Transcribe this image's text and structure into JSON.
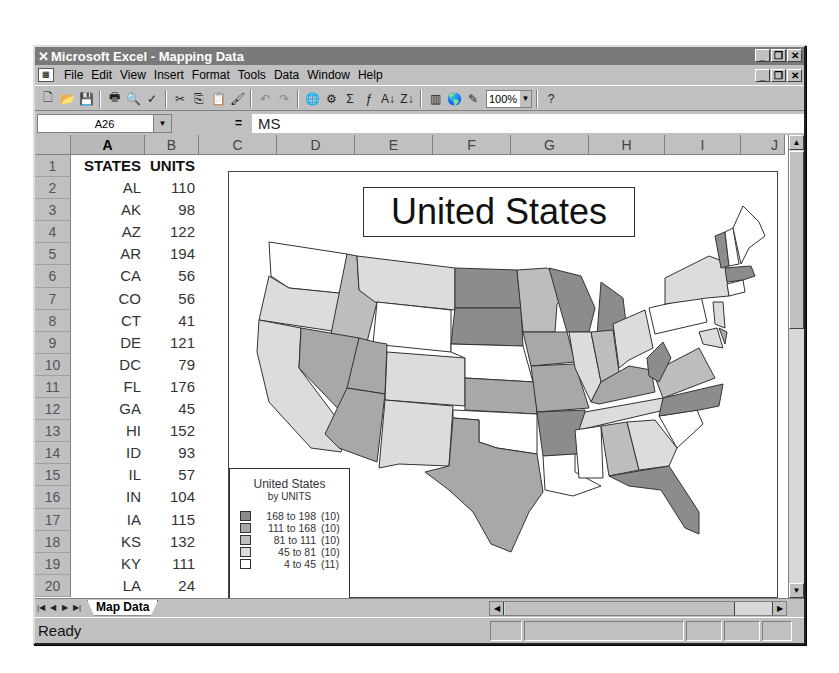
{
  "window": {
    "title": "Microsoft Excel - Mapping Data",
    "app_icon": "excel-x-icon",
    "controls": [
      "_",
      "❐",
      "✕"
    ]
  },
  "menubar": {
    "items": [
      {
        "label": "File",
        "accel": "F"
      },
      {
        "label": "Edit",
        "accel": "E"
      },
      {
        "label": "View",
        "accel": "V"
      },
      {
        "label": "Insert",
        "accel": "I"
      },
      {
        "label": "Format",
        "accel": "o"
      },
      {
        "label": "Tools",
        "accel": "T"
      },
      {
        "label": "Data",
        "accel": "D"
      },
      {
        "label": "Window",
        "accel": "W"
      },
      {
        "label": "Help",
        "accel": "H"
      }
    ],
    "doc_controls": [
      "_",
      "❐",
      "✕"
    ]
  },
  "toolbar": {
    "icons": [
      {
        "name": "new-icon",
        "glyph": "🗋"
      },
      {
        "name": "open-icon",
        "glyph": "📂"
      },
      {
        "name": "save-icon",
        "glyph": "💾"
      },
      {
        "sep": true
      },
      {
        "name": "print-icon",
        "glyph": "🖶"
      },
      {
        "name": "print-preview-icon",
        "glyph": "🔍"
      },
      {
        "name": "spelling-icon",
        "glyph": "✓"
      },
      {
        "sep": true
      },
      {
        "name": "cut-icon",
        "glyph": "✂"
      },
      {
        "name": "copy-icon",
        "glyph": "⎘"
      },
      {
        "name": "paste-icon",
        "glyph": "📋"
      },
      {
        "name": "format-painter-icon",
        "glyph": "🖌"
      },
      {
        "sep": true
      },
      {
        "name": "undo-icon",
        "glyph": "↶",
        "dim": true
      },
      {
        "name": "redo-icon",
        "glyph": "↷",
        "dim": true
      },
      {
        "sep": true
      },
      {
        "name": "insert-hyperlink-icon",
        "glyph": "🌐"
      },
      {
        "name": "web-toolbar-icon",
        "glyph": "⚙"
      },
      {
        "name": "autosum-icon",
        "glyph": "Σ"
      },
      {
        "name": "paste-function-icon",
        "glyph": "ƒ"
      },
      {
        "name": "sort-ascending-icon",
        "glyph": "↓"
      },
      {
        "name": "sort-descending-icon",
        "glyph": "↓"
      },
      {
        "sep": true
      },
      {
        "name": "chart-wizard-icon",
        "glyph": "▥"
      },
      {
        "name": "map-icon",
        "glyph": "🌎"
      },
      {
        "name": "drawing-icon",
        "glyph": "✎"
      }
    ],
    "zoom": "100%",
    "help_icon": "office-assistant-icon"
  },
  "formula_bar": {
    "name_box": "A26",
    "equals": "=",
    "content": "MS"
  },
  "columns": [
    "A",
    "B",
    "C",
    "D",
    "E",
    "F",
    "G",
    "H",
    "I",
    "J"
  ],
  "active_column": "A",
  "sheet": {
    "header": {
      "row": "1",
      "a": "STATES",
      "b": "UNITS"
    },
    "rows": [
      {
        "row": "2",
        "a": "AL",
        "b": "110"
      },
      {
        "row": "3",
        "a": "AK",
        "b": "98"
      },
      {
        "row": "4",
        "a": "AZ",
        "b": "122"
      },
      {
        "row": "5",
        "a": "AR",
        "b": "194"
      },
      {
        "row": "6",
        "a": "CA",
        "b": "56"
      },
      {
        "row": "7",
        "a": "CO",
        "b": "56"
      },
      {
        "row": "8",
        "a": "CT",
        "b": "41"
      },
      {
        "row": "9",
        "a": "DE",
        "b": "121"
      },
      {
        "row": "10",
        "a": "DC",
        "b": "79"
      },
      {
        "row": "11",
        "a": "FL",
        "b": "176"
      },
      {
        "row": "12",
        "a": "GA",
        "b": "45"
      },
      {
        "row": "13",
        "a": "HI",
        "b": "152"
      },
      {
        "row": "14",
        "a": "ID",
        "b": "93"
      },
      {
        "row": "15",
        "a": "IL",
        "b": "57"
      },
      {
        "row": "16",
        "a": "IN",
        "b": "104"
      },
      {
        "row": "17",
        "a": "IA",
        "b": "115"
      },
      {
        "row": "18",
        "a": "KS",
        "b": "132"
      },
      {
        "row": "19",
        "a": "KY",
        "b": "111"
      },
      {
        "row": "20",
        "a": "LA",
        "b": "24"
      }
    ]
  },
  "map": {
    "title": "United States",
    "legend": {
      "title": "United States",
      "subtitle": "by UNITS",
      "items": [
        {
          "range": "168 to 198",
          "count": "(10)",
          "color": "#8c8c8c"
        },
        {
          "range": "111 to 168",
          "count": "(10)",
          "color": "#a8a8a8"
        },
        {
          "range": "81 to 111",
          "count": "(10)",
          "color": "#bdbdbd"
        },
        {
          "range": "45 to  81",
          "count": "(10)",
          "color": "#dcdcdc"
        },
        {
          "range": "4 to  45",
          "count": "(11)",
          "color": "#ffffff"
        }
      ]
    }
  },
  "sheet_tabs": {
    "nav": [
      "|◀",
      "◀",
      "▶",
      "▶|"
    ],
    "tabs": [
      "Map Data"
    ]
  },
  "status": {
    "text": "Ready"
  },
  "colors": {
    "chrome": "#c0c0c0",
    "titlebar": "#7a7a7a",
    "shade_1": "#8c8c8c",
    "shade_2": "#a8a8a8",
    "shade_3": "#bdbdbd",
    "shade_4": "#dcdcdc",
    "shade_5": "#ffffff"
  }
}
